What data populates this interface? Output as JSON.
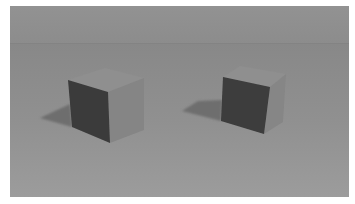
{
  "image": {
    "description": "3D render of two cubes on a gray floor with shadows",
    "caption": "Two gray cubes with dark front faces casting shadows to the left",
    "colors": {
      "border": "#ffffff",
      "wall": "#8f8f8f",
      "horizon_band": "#878787",
      "floor_top": "#8b8b8b",
      "floor_bottom": "#9a9a9a",
      "cube_top": "#8e8e8e",
      "cube_right": "#878787",
      "cube_front": "#3a3a3a",
      "shadow": "#6d6d6d"
    },
    "objects": [
      {
        "name": "left-cube",
        "front_face": "dark",
        "shadow_direction": "left"
      },
      {
        "name": "right-cube",
        "front_face": "dark",
        "shadow_direction": "left"
      }
    ]
  }
}
